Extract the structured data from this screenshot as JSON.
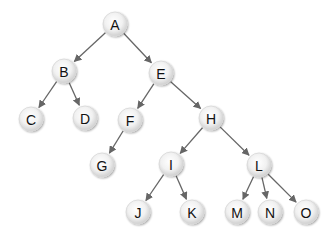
{
  "diagram": {
    "type": "binary-tree",
    "colors": {
      "background": "#ffffff",
      "node_fill_center": "#ffffff",
      "node_fill_edge": "#cfcfcf",
      "node_stroke": "#d8d8d8",
      "edge": "#666666",
      "label": "#111111"
    },
    "node_radius": 12,
    "nodes": [
      {
        "id": "A",
        "label": "A",
        "x": 115,
        "y": 24
      },
      {
        "id": "B",
        "label": "B",
        "x": 64,
        "y": 71
      },
      {
        "id": "E",
        "label": "E",
        "x": 161,
        "y": 73
      },
      {
        "id": "C",
        "label": "C",
        "x": 31,
        "y": 119
      },
      {
        "id": "D",
        "label": "D",
        "x": 85,
        "y": 118
      },
      {
        "id": "F",
        "label": "F",
        "x": 130,
        "y": 120
      },
      {
        "id": "H",
        "label": "H",
        "x": 211,
        "y": 118
      },
      {
        "id": "G",
        "label": "G",
        "x": 102,
        "y": 165
      },
      {
        "id": "I",
        "label": "I",
        "x": 171,
        "y": 164
      },
      {
        "id": "L",
        "label": "L",
        "x": 259,
        "y": 165
      },
      {
        "id": "J",
        "label": "J",
        "x": 138,
        "y": 212
      },
      {
        "id": "K",
        "label": "K",
        "x": 192,
        "y": 212
      },
      {
        "id": "M",
        "label": "M",
        "x": 237,
        "y": 212
      },
      {
        "id": "N",
        "label": "N",
        "x": 270,
        "y": 212
      },
      {
        "id": "O",
        "label": "O",
        "x": 306,
        "y": 212
      }
    ],
    "edges": [
      {
        "from": "A",
        "to": "B"
      },
      {
        "from": "A",
        "to": "E"
      },
      {
        "from": "B",
        "to": "C"
      },
      {
        "from": "B",
        "to": "D"
      },
      {
        "from": "E",
        "to": "F"
      },
      {
        "from": "E",
        "to": "H"
      },
      {
        "from": "F",
        "to": "G"
      },
      {
        "from": "H",
        "to": "I"
      },
      {
        "from": "H",
        "to": "L"
      },
      {
        "from": "I",
        "to": "J"
      },
      {
        "from": "I",
        "to": "K"
      },
      {
        "from": "L",
        "to": "M"
      },
      {
        "from": "L",
        "to": "N"
      },
      {
        "from": "L",
        "to": "O"
      }
    ]
  }
}
